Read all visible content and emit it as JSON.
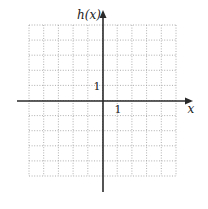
{
  "chart_data": {
    "type": "line",
    "title": "",
    "xlabel": "x",
    "ylabel": "h(x)",
    "x_tick_labels": [
      {
        "value": 1,
        "label": "1"
      }
    ],
    "y_tick_labels": [
      {
        "value": 1,
        "label": "1"
      }
    ],
    "xlim": [
      -5,
      5
    ],
    "ylim": [
      -5,
      5
    ],
    "grid": true,
    "grid_style": "dotted",
    "grid_cells": {
      "columns": 10,
      "rows": 10
    },
    "series": [],
    "legend": null
  },
  "labels": {
    "y_axis": "h(x)",
    "x_axis": "x",
    "x_tick": "1",
    "y_tick": "1"
  },
  "colors": {
    "axis": "#2a2a2a",
    "grid": "#9a9a9a",
    "text": "#222222",
    "background": "#ffffff"
  },
  "layout": {
    "grid_left": 29,
    "grid_top": 25,
    "cell_w": 14.7,
    "cell_h": 15.1,
    "origin_x": 103,
    "origin_y": 101
  }
}
